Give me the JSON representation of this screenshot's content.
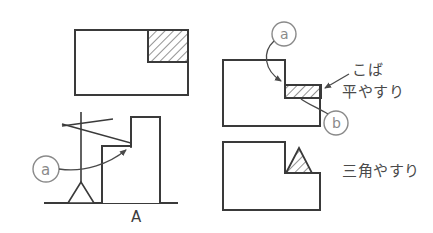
{
  "figure": {
    "colors": {
      "outline": "#3a3a3a",
      "hatch": "#3a3a3a",
      "leader": "#4a4a4a",
      "text": "#4a4a4a",
      "background": "#ffffff"
    }
  },
  "views": {
    "top_left": {
      "name": "plan-view-notched-block",
      "hatch_region": "corner-square"
    },
    "bottom_left": {
      "name": "elevation-view-with-file",
      "section_label": "A",
      "callout": "ⓐ"
    },
    "right_top": {
      "name": "step-block-flat-file",
      "callout_a": "ⓐ",
      "callout_b": "ⓑ"
    },
    "right_bottom": {
      "name": "step-block-triangular-file"
    }
  },
  "callouts": {
    "a_circle_left": "a",
    "a_circle_right": "a",
    "b_circle_right": "b",
    "section_letter": "A"
  },
  "annotations": {
    "koba": "こば",
    "hira_yasuri": "平やすり",
    "sankaku_yasuri": "三角やすり"
  }
}
